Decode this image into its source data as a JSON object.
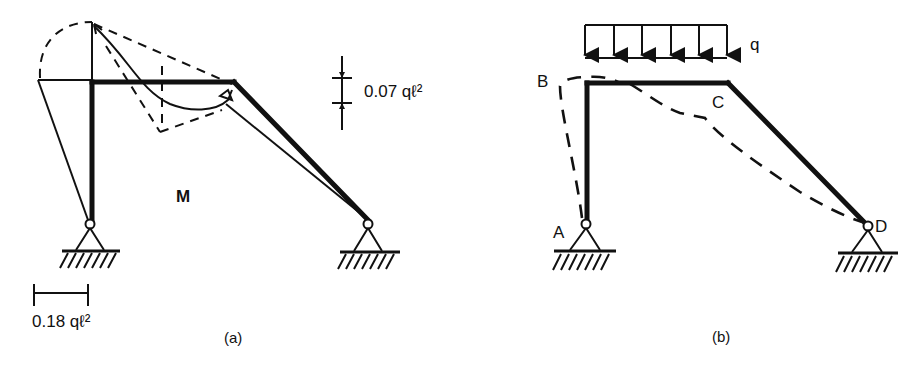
{
  "figure": {
    "panels": [
      {
        "id": "a",
        "caption": "(a)",
        "diagram_label": "M",
        "annotations": {
          "top_scale": "0.07 qℓ²",
          "bottom_scale": "0.18 qℓ²"
        }
      },
      {
        "id": "b",
        "caption": "(b)",
        "load_label": "q",
        "load_arrow_count": 6,
        "node_labels": {
          "A": "A",
          "B": "B",
          "C": "C",
          "D": "D"
        }
      }
    ],
    "colors": {
      "ink": "#111111",
      "background": "#ffffff"
    }
  }
}
